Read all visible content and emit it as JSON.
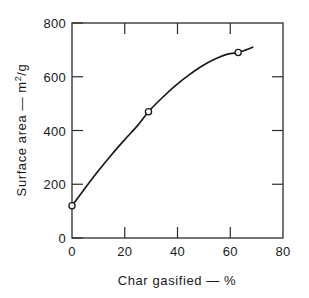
{
  "chart_data": {
    "type": "line",
    "title": "",
    "subtitle": "",
    "xlabel": "Char gasified — %",
    "ylabel": "Surface area — m2/g",
    "ylabel_parts": {
      "prefix": "Surface area — m",
      "superscript": "2",
      "suffix": "/g"
    },
    "xlim": [
      0,
      80
    ],
    "ylim": [
      0,
      800
    ],
    "xticks": [
      0,
      20,
      40,
      60,
      80
    ],
    "yticks": [
      0,
      200,
      400,
      600,
      800
    ],
    "xticklabels": [
      "0",
      "20",
      "40",
      "60",
      "80"
    ],
    "yticklabels": [
      "0",
      "200",
      "400",
      "600",
      "800"
    ],
    "grid": false,
    "legend": null,
    "tick_direction": "in",
    "frame": "full-box",
    "series": [
      {
        "name": "Surface area vs char gasified",
        "marker": "open-circle",
        "line_color": "#1a1a1a",
        "marker_face_color": "#ffffff",
        "x": [
          0,
          29,
          63
        ],
        "y": [
          120,
          470,
          690
        ],
        "curve_x": [
          0,
          5,
          10,
          15,
          20,
          25,
          29,
          34,
          39,
          44,
          49,
          54,
          59,
          63,
          66,
          68.5
        ],
        "curve_y": [
          120,
          186,
          250,
          310,
          366,
          420,
          470,
          520,
          565,
          604,
          638,
          665,
          684,
          690,
          700,
          710
        ]
      }
    ]
  },
  "colors": {
    "axis": "#2b2b2b",
    "curve": "#1a1a1a",
    "marker_fill": "#ffffff",
    "background": "#ffffff"
  }
}
